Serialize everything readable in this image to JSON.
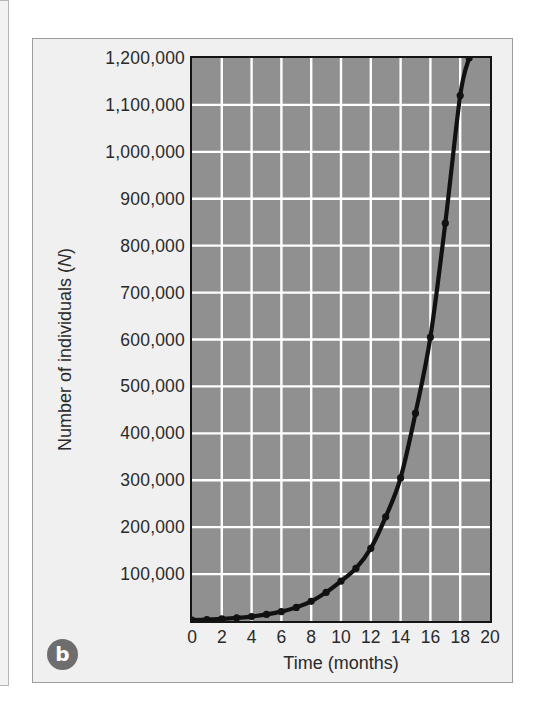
{
  "figure": {
    "panel_label": "b",
    "background_color": "#f0f0f0",
    "plot_fill_color": "#909090",
    "grid_color": "#ffffff",
    "curve_color": "#111111"
  },
  "chart_data": {
    "type": "line",
    "title": "",
    "subtitle": "",
    "xlabel": "Time (months)",
    "ylabel": "Number of individuals (N)",
    "ylabel_parts": {
      "prefix": "Number of individuals (",
      "italic": "N",
      "suffix": ")"
    },
    "xlim": [
      0,
      20
    ],
    "ylim": [
      0,
      1200000
    ],
    "grid": true,
    "legend": null,
    "x_ticks": [
      0,
      2,
      4,
      6,
      8,
      10,
      12,
      14,
      16,
      18,
      20
    ],
    "x_ticklabels": [
      "0",
      "2",
      "4",
      "6",
      "8",
      "10",
      "12",
      "14",
      "16",
      "18",
      "20"
    ],
    "y_ticks": [
      100000,
      200000,
      300000,
      400000,
      500000,
      600000,
      700000,
      800000,
      900000,
      1000000,
      1100000,
      1200000
    ],
    "y_ticklabels": [
      "100,000",
      "200,000",
      "300,000",
      "400,000",
      "500,000",
      "600,000",
      "700,000",
      "800,000",
      "900,000",
      "1,000,000",
      "1,100,000",
      "1,200,000"
    ],
    "series": [
      {
        "name": "Exponential population growth",
        "marker": "filled-circle",
        "x": [
          0,
          1,
          2,
          3,
          4,
          5,
          6,
          7,
          8,
          9,
          10,
          11,
          12,
          13,
          14,
          15,
          16,
          17,
          18,
          18.6
        ],
        "values": [
          2000,
          3000,
          4500,
          6500,
          9500,
          14000,
          20000,
          29000,
          42000,
          61000,
          85000,
          112000,
          155000,
          222000,
          305000,
          443000,
          605000,
          848000,
          1120000,
          1200000
        ]
      }
    ]
  }
}
